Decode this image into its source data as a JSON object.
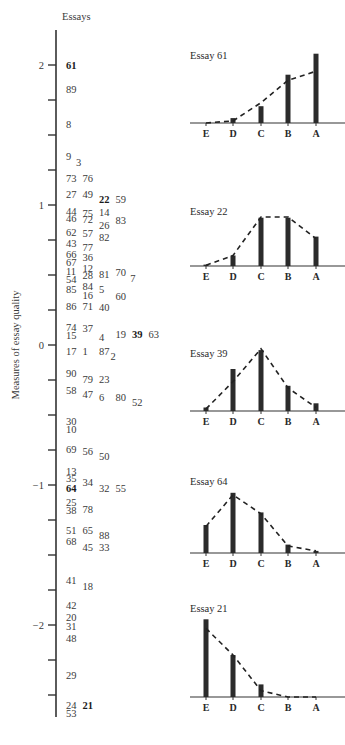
{
  "chart_data": [
    {
      "type": "scatter",
      "title": "Essays",
      "ylabel": "Measures of essay quality",
      "xlabel": "",
      "ylim": [
        -2.65,
        2.25
      ],
      "yticks": [
        2,
        1.75,
        1.5,
        1.25,
        1,
        0.75,
        0.5,
        0.25,
        0,
        -0.25,
        -0.5,
        -0.75,
        -1,
        -1.25,
        -1.5,
        -1.75,
        -2,
        -2.25,
        -2.5
      ],
      "ytick_labels": {
        "2": "2",
        "1": "1",
        "0": "0",
        "-1": "−1",
        "-2": "−2"
      },
      "essays": [
        {
          "id": "61",
          "y": 2.0,
          "col": 0,
          "bold": true
        },
        {
          "id": "89",
          "y": 1.83,
          "col": 0
        },
        {
          "id": "8",
          "y": 1.58,
          "col": 0
        },
        {
          "id": "9",
          "y": 1.35,
          "col": 0
        },
        {
          "id": "3",
          "y": 1.31,
          "col": 0.6
        },
        {
          "id": "73",
          "y": 1.19,
          "col": 0
        },
        {
          "id": "76",
          "y": 1.19,
          "col": 1
        },
        {
          "id": "27",
          "y": 1.08,
          "col": 0
        },
        {
          "id": "49",
          "y": 1.08,
          "col": 1
        },
        {
          "id": "22",
          "y": 1.04,
          "col": 2,
          "bold": true
        },
        {
          "id": "59",
          "y": 1.04,
          "col": 3
        },
        {
          "id": "44",
          "y": 0.96,
          "col": 0
        },
        {
          "id": "75",
          "y": 0.94,
          "col": 1
        },
        {
          "id": "14",
          "y": 0.95,
          "col": 2
        },
        {
          "id": "46",
          "y": 0.91,
          "col": 0
        },
        {
          "id": "72",
          "y": 0.9,
          "col": 1
        },
        {
          "id": "83",
          "y": 0.89,
          "col": 3
        },
        {
          "id": "26",
          "y": 0.86,
          "col": 2
        },
        {
          "id": "62",
          "y": 0.81,
          "col": 0
        },
        {
          "id": "57",
          "y": 0.8,
          "col": 1
        },
        {
          "id": "82",
          "y": 0.77,
          "col": 2
        },
        {
          "id": "43",
          "y": 0.73,
          "col": 0
        },
        {
          "id": "77",
          "y": 0.7,
          "col": 1
        },
        {
          "id": "66",
          "y": 0.65,
          "col": 0
        },
        {
          "id": "36",
          "y": 0.63,
          "col": 1
        },
        {
          "id": "67",
          "y": 0.59,
          "col": 0
        },
        {
          "id": "12",
          "y": 0.55,
          "col": 1
        },
        {
          "id": "11",
          "y": 0.53,
          "col": 0
        },
        {
          "id": "28",
          "y": 0.5,
          "col": 1
        },
        {
          "id": "81",
          "y": 0.51,
          "col": 2
        },
        {
          "id": "70",
          "y": 0.52,
          "col": 3
        },
        {
          "id": "7",
          "y": 0.48,
          "col": 3.9
        },
        {
          "id": "54",
          "y": 0.47,
          "col": 0
        },
        {
          "id": "84",
          "y": 0.42,
          "col": 1
        },
        {
          "id": "85",
          "y": 0.4,
          "col": 0
        },
        {
          "id": "5",
          "y": 0.4,
          "col": 2
        },
        {
          "id": "16",
          "y": 0.36,
          "col": 1
        },
        {
          "id": "60",
          "y": 0.35,
          "col": 3
        },
        {
          "id": "86",
          "y": 0.28,
          "col": 0
        },
        {
          "id": "71",
          "y": 0.28,
          "col": 1
        },
        {
          "id": "40",
          "y": 0.27,
          "col": 2
        },
        {
          "id": "74",
          "y": 0.13,
          "col": 0
        },
        {
          "id": "37",
          "y": 0.12,
          "col": 1
        },
        {
          "id": "15",
          "y": 0.07,
          "col": 0
        },
        {
          "id": "4",
          "y": 0.06,
          "col": 2
        },
        {
          "id": "19",
          "y": 0.08,
          "col": 3
        },
        {
          "id": "39",
          "y": 0.08,
          "col": 4,
          "bold": true
        },
        {
          "id": "63",
          "y": 0.08,
          "col": 5
        },
        {
          "id": "17",
          "y": -0.04,
          "col": 0
        },
        {
          "id": "1",
          "y": -0.04,
          "col": 1
        },
        {
          "id": "87",
          "y": -0.04,
          "col": 2
        },
        {
          "id": "2",
          "y": -0.08,
          "col": 2.7
        },
        {
          "id": "90",
          "y": -0.2,
          "col": 0
        },
        {
          "id": "79",
          "y": -0.24,
          "col": 1
        },
        {
          "id": "23",
          "y": -0.24,
          "col": 2
        },
        {
          "id": "58",
          "y": -0.32,
          "col": 0
        },
        {
          "id": "47",
          "y": -0.35,
          "col": 1
        },
        {
          "id": "6",
          "y": -0.37,
          "col": 2
        },
        {
          "id": "80",
          "y": -0.37,
          "col": 3
        },
        {
          "id": "52",
          "y": -0.41,
          "col": 4
        },
        {
          "id": "30",
          "y": -0.54,
          "col": 0
        },
        {
          "id": "10",
          "y": -0.6,
          "col": 0
        },
        {
          "id": "69",
          "y": -0.74,
          "col": 0
        },
        {
          "id": "56",
          "y": -0.76,
          "col": 1
        },
        {
          "id": "50",
          "y": -0.79,
          "col": 2
        },
        {
          "id": "13",
          "y": -0.9,
          "col": 0
        },
        {
          "id": "35",
          "y": -0.95,
          "col": 0
        },
        {
          "id": "34",
          "y": -0.98,
          "col": 1
        },
        {
          "id": "32",
          "y": -1.02,
          "col": 2
        },
        {
          "id": "55",
          "y": -1.02,
          "col": 3
        },
        {
          "id": "64",
          "y": -1.02,
          "col": 0,
          "bold": true
        },
        {
          "id": "25",
          "y": -1.12,
          "col": 0
        },
        {
          "id": "38",
          "y": -1.18,
          "col": 0
        },
        {
          "id": "78",
          "y": -1.17,
          "col": 1
        },
        {
          "id": "51",
          "y": -1.32,
          "col": 0
        },
        {
          "id": "65",
          "y": -1.32,
          "col": 1
        },
        {
          "id": "88",
          "y": -1.36,
          "col": 2
        },
        {
          "id": "68",
          "y": -1.4,
          "col": 0
        },
        {
          "id": "45",
          "y": -1.44,
          "col": 1
        },
        {
          "id": "33",
          "y": -1.44,
          "col": 2
        },
        {
          "id": "41",
          "y": -1.68,
          "col": 0
        },
        {
          "id": "18",
          "y": -1.72,
          "col": 1
        },
        {
          "id": "42",
          "y": -1.86,
          "col": 0
        },
        {
          "id": "20",
          "y": -1.94,
          "col": 0
        },
        {
          "id": "31",
          "y": -2.01,
          "col": 0
        },
        {
          "id": "48",
          "y": -2.09,
          "col": 0
        },
        {
          "id": "29",
          "y": -2.36,
          "col": 0
        },
        {
          "id": "24",
          "y": -2.57,
          "col": 0
        },
        {
          "id": "21",
          "y": -2.57,
          "col": 1,
          "bold": true
        },
        {
          "id": "53",
          "y": -2.63,
          "col": 0
        }
      ]
    },
    {
      "type": "bar",
      "title": "Essay 61",
      "categories": [
        "E",
        "D",
        "C",
        "B",
        "A"
      ],
      "observed": [
        0.0,
        0.07,
        0.24,
        0.69,
        0.99
      ],
      "expected": [
        0.0,
        0.03,
        0.29,
        0.61,
        0.74
      ],
      "expected_style": "dashed-line"
    },
    {
      "type": "bar",
      "title": "Essay 22",
      "categories": [
        "E",
        "D",
        "C",
        "B",
        "A"
      ],
      "observed": [
        0.02,
        0.15,
        0.69,
        0.69,
        0.42
      ],
      "expected": [
        0.01,
        0.15,
        0.7,
        0.7,
        0.39
      ],
      "expected_style": "dashed-line"
    },
    {
      "type": "bar",
      "title": "Essay 39",
      "categories": [
        "E",
        "D",
        "C",
        "B",
        "A"
      ],
      "observed": [
        0.05,
        0.6,
        0.87,
        0.36,
        0.11
      ],
      "expected": [
        0.03,
        0.42,
        0.89,
        0.33,
        0.05
      ],
      "expected_style": "dashed-line"
    },
    {
      "type": "bar",
      "title": "Essay 64",
      "categories": [
        "E",
        "D",
        "C",
        "B",
        "A"
      ],
      "observed": [
        0.4,
        0.86,
        0.58,
        0.12,
        0.03
      ],
      "expected": [
        0.38,
        0.83,
        0.56,
        0.1,
        0.03
      ],
      "expected_style": "dashed-line"
    },
    {
      "type": "bar",
      "title": "Essay 21",
      "categories": [
        "E",
        "D",
        "C",
        "B",
        "A"
      ],
      "observed": [
        1.11,
        0.6,
        0.18,
        0.0,
        0.0
      ],
      "expected": [
        0.98,
        0.6,
        0.09,
        0.0,
        0.0
      ],
      "expected_style": "dashed-line"
    }
  ]
}
